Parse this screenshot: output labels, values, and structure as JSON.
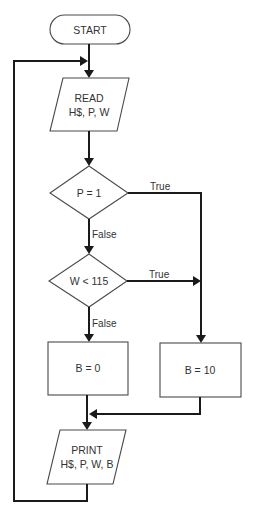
{
  "diagram": {
    "type": "flowchart",
    "nodes": {
      "start": {
        "shape": "terminator",
        "label": "START"
      },
      "read": {
        "shape": "input-output",
        "line1": "READ",
        "line2": "H$, P, W"
      },
      "decision1": {
        "shape": "decision",
        "label": "P = 1"
      },
      "decision2": {
        "shape": "decision",
        "label": "W < 115"
      },
      "set_b0": {
        "shape": "process",
        "label": "B = 0"
      },
      "set_b10": {
        "shape": "process",
        "label": "B = 10"
      },
      "print": {
        "shape": "input-output",
        "line1": "PRINT",
        "line2": "H$, P, W, B"
      }
    },
    "edges": {
      "d1_true": "True",
      "d1_false": "False",
      "d2_true": "True",
      "d2_false": "False"
    },
    "connections": [
      {
        "from": "start",
        "to": "read"
      },
      {
        "from": "read",
        "to": "decision1"
      },
      {
        "from": "decision1",
        "to": "set_b10",
        "label": "True"
      },
      {
        "from": "decision1",
        "to": "decision2",
        "label": "False"
      },
      {
        "from": "decision2",
        "to": "set_b10",
        "label": "True"
      },
      {
        "from": "decision2",
        "to": "set_b0",
        "label": "False"
      },
      {
        "from": "set_b0",
        "to": "print"
      },
      {
        "from": "set_b10",
        "to": "print"
      },
      {
        "from": "print",
        "to": "read",
        "label": "loop"
      }
    ]
  }
}
